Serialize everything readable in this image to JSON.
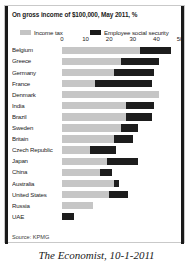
{
  "caption": "The Economist, 10-1-2011",
  "source": "Source: KPMG",
  "colors": {
    "income_tax": "#c6c6c6",
    "social_security": "#1d1d1d",
    "text": "#1b1b1b",
    "background": "#ffffff"
  },
  "chart_data": {
    "type": "bar",
    "orientation": "horizontal",
    "stacked": true,
    "title": "On gross income of $100,000, May 2011, %",
    "xlabel": "",
    "ylabel": "",
    "xlim": [
      0,
      50
    ],
    "xticks": [
      0,
      10,
      20,
      30,
      40,
      50
    ],
    "tick_labels": [
      "0",
      "10",
      "20",
      "30",
      "40",
      "50"
    ],
    "grid": false,
    "legend_position": "top",
    "legend": [
      "Income tax",
      "Employee social security"
    ],
    "categories": [
      "Belgium",
      "Greece",
      "Germany",
      "France",
      "Denmark",
      "India",
      "Brazil",
      "Sweden",
      "Britain",
      "Czech Republic",
      "Japan",
      "China",
      "Australia",
      "United States",
      "Russia",
      "UAE"
    ],
    "series": [
      {
        "name": "Income tax",
        "color": "#c6c6c6",
        "values": [
          33,
          25,
          22,
          14,
          41,
          27,
          27,
          25,
          22,
          12,
          19,
          16,
          22,
          20,
          13,
          0
        ]
      },
      {
        "name": "Employee social security",
        "color": "#1d1d1d",
        "values": [
          13,
          16,
          17,
          24,
          0,
          12,
          11,
          7,
          8,
          11,
          13,
          5,
          2,
          8,
          0,
          5
        ]
      }
    ],
    "totals": [
      46,
      41,
      39,
      38,
      41,
      39,
      38,
      32,
      30,
      23,
      32,
      21,
      24,
      28,
      13,
      5
    ],
    "source": "Source: KPMG"
  }
}
